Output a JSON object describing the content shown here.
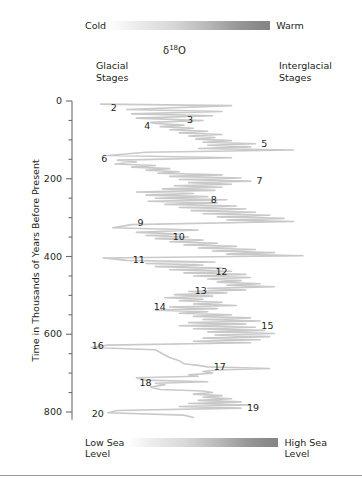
{
  "figure": {
    "delta_title": "δ",
    "delta_sup": "18",
    "delta_tail": "O",
    "glacial_heading": "Glacial\nStages",
    "interglacial_heading": "Interglacial\nStages",
    "y_axis_title": "Time in Thousands of Years Before Present"
  },
  "legends": {
    "top": {
      "left_label": "Cold",
      "right_label": "Warm",
      "from_color": "#fdfdfd",
      "to_color": "#858585"
    },
    "bottom": {
      "left_label": "Low Sea\nLevel",
      "right_label": "High Sea\nLevel",
      "from_color": "#fdfdfd",
      "to_color": "#858585"
    }
  },
  "chart_data": {
    "type": "line",
    "title": "δ18O",
    "xlabel": "δ18O (cold/low sea level  →  warm/high sea level)",
    "ylabel": "Time in Thousands of Years Before Present",
    "orientation": "vertical-time-axis",
    "grid": false,
    "legend_position": "none",
    "ylim": [
      0,
      820
    ],
    "y_tick_labels": [
      "0",
      "200",
      "400",
      "600",
      "800"
    ],
    "y_ticks": [
      0,
      200,
      400,
      600,
      800
    ],
    "y_minor_tick_interval": 50,
    "xlim": [
      0,
      1
    ],
    "line_color": "#c9c9c9",
    "axis_color": "#6d6d6d",
    "series_name": "Marine oxygen isotope record",
    "stage_labels": [
      {
        "stage": "2",
        "age_ka": 18,
        "side": "glacial"
      },
      {
        "stage": "3",
        "age_ka": 50,
        "side": "glacial"
      },
      {
        "stage": "4",
        "age_ka": 65,
        "side": "glacial"
      },
      {
        "stage": "5",
        "age_ka": 110,
        "side": "interglacial"
      },
      {
        "stage": "6",
        "age_ka": 150,
        "side": "glacial"
      },
      {
        "stage": "7",
        "age_ka": 205,
        "side": "interglacial"
      },
      {
        "stage": "8",
        "age_ka": 255,
        "side": "glacial"
      },
      {
        "stage": "9",
        "age_ka": 315,
        "side": "interglacial"
      },
      {
        "stage": "10",
        "age_ka": 350,
        "side": "glacial"
      },
      {
        "stage": "11",
        "age_ka": 410,
        "side": "interglacial"
      },
      {
        "stage": "12",
        "age_ka": 440,
        "side": "glacial"
      },
      {
        "stage": "13",
        "age_ka": 490,
        "side": "interglacial"
      },
      {
        "stage": "14",
        "age_ka": 530,
        "side": "glacial"
      },
      {
        "stage": "15",
        "age_ka": 580,
        "side": "interglacial"
      },
      {
        "stage": "16",
        "age_ka": 630,
        "side": "glacial"
      },
      {
        "stage": "17",
        "age_ka": 685,
        "side": "interglacial"
      },
      {
        "stage": "18",
        "age_ka": 725,
        "side": "glacial"
      },
      {
        "stage": "19",
        "age_ka": 790,
        "side": "interglacial"
      },
      {
        "stage": "20",
        "age_ka": 805,
        "side": "glacial"
      }
    ],
    "curve_points": [
      [
        0.07,
        8
      ],
      [
        0.62,
        12
      ],
      [
        0.18,
        22
      ],
      [
        0.58,
        27
      ],
      [
        0.2,
        33
      ],
      [
        0.54,
        38
      ],
      [
        0.22,
        44
      ],
      [
        0.5,
        50
      ],
      [
        0.28,
        55
      ],
      [
        0.3,
        58
      ],
      [
        0.42,
        62
      ],
      [
        0.32,
        66
      ],
      [
        0.46,
        70
      ],
      [
        0.36,
        74
      ],
      [
        0.52,
        78
      ],
      [
        0.4,
        82
      ],
      [
        0.58,
        86
      ],
      [
        0.44,
        90
      ],
      [
        0.55,
        94
      ],
      [
        0.47,
        98
      ],
      [
        0.62,
        102
      ],
      [
        0.5,
        106
      ],
      [
        0.72,
        110
      ],
      [
        0.52,
        114
      ],
      [
        0.7,
        118
      ],
      [
        0.48,
        122
      ],
      [
        0.88,
        126
      ],
      [
        0.26,
        132
      ],
      [
        0.1,
        140
      ],
      [
        0.62,
        146
      ],
      [
        0.14,
        152
      ],
      [
        0.22,
        157
      ],
      [
        0.13,
        162
      ],
      [
        0.3,
        166
      ],
      [
        0.2,
        170
      ],
      [
        0.36,
        174
      ],
      [
        0.26,
        178
      ],
      [
        0.4,
        182
      ],
      [
        0.31,
        186
      ],
      [
        0.58,
        190
      ],
      [
        0.36,
        194
      ],
      [
        0.66,
        198
      ],
      [
        0.4,
        202
      ],
      [
        0.7,
        206
      ],
      [
        0.44,
        210
      ],
      [
        0.62,
        214
      ],
      [
        0.38,
        218
      ],
      [
        0.58,
        222
      ],
      [
        0.33,
        226
      ],
      [
        0.55,
        230
      ],
      [
        0.22,
        234
      ],
      [
        0.46,
        238
      ],
      [
        0.26,
        242
      ],
      [
        0.52,
        246
      ],
      [
        0.3,
        250
      ],
      [
        0.6,
        254
      ],
      [
        0.27,
        258
      ],
      [
        0.56,
        262
      ],
      [
        0.34,
        266
      ],
      [
        0.64,
        270
      ],
      [
        0.4,
        274
      ],
      [
        0.68,
        278
      ],
      [
        0.45,
        282
      ],
      [
        0.72,
        286
      ],
      [
        0.5,
        290
      ],
      [
        0.78,
        294
      ],
      [
        0.56,
        298
      ],
      [
        0.84,
        302
      ],
      [
        0.6,
        306
      ],
      [
        0.88,
        310
      ],
      [
        0.2,
        318
      ],
      [
        0.12,
        326
      ],
      [
        0.48,
        332
      ],
      [
        0.22,
        338
      ],
      [
        0.4,
        342
      ],
      [
        0.26,
        346
      ],
      [
        0.44,
        350
      ],
      [
        0.3,
        354
      ],
      [
        0.5,
        358
      ],
      [
        0.36,
        362
      ],
      [
        0.56,
        366
      ],
      [
        0.42,
        370
      ],
      [
        0.64,
        374
      ],
      [
        0.48,
        378
      ],
      [
        0.72,
        382
      ],
      [
        0.54,
        386
      ],
      [
        0.8,
        390
      ],
      [
        0.6,
        394
      ],
      [
        0.92,
        398
      ],
      [
        0.08,
        404
      ],
      [
        0.18,
        410
      ],
      [
        0.55,
        414
      ],
      [
        0.26,
        418
      ],
      [
        0.5,
        422
      ],
      [
        0.3,
        426
      ],
      [
        0.58,
        430
      ],
      [
        0.36,
        434
      ],
      [
        0.62,
        438
      ],
      [
        0.42,
        442
      ],
      [
        0.68,
        446
      ],
      [
        0.46,
        450
      ],
      [
        0.7,
        454
      ],
      [
        0.52,
        458
      ],
      [
        0.66,
        462
      ],
      [
        0.56,
        466
      ],
      [
        0.74,
        470
      ],
      [
        0.6,
        474
      ],
      [
        0.8,
        478
      ],
      [
        0.52,
        482
      ],
      [
        0.68,
        486
      ],
      [
        0.44,
        490
      ],
      [
        0.6,
        494
      ],
      [
        0.38,
        498
      ],
      [
        0.54,
        502
      ],
      [
        0.34,
        506
      ],
      [
        0.5,
        510
      ],
      [
        0.4,
        514
      ],
      [
        0.58,
        518
      ],
      [
        0.46,
        522
      ],
      [
        0.64,
        526
      ],
      [
        0.36,
        530
      ],
      [
        0.56,
        534
      ],
      [
        0.3,
        538
      ],
      [
        0.52,
        542
      ],
      [
        0.4,
        546
      ],
      [
        0.62,
        550
      ],
      [
        0.46,
        554
      ],
      [
        0.7,
        558
      ],
      [
        0.5,
        562
      ],
      [
        0.74,
        566
      ],
      [
        0.44,
        570
      ],
      [
        0.68,
        574
      ],
      [
        0.4,
        578
      ],
      [
        0.72,
        582
      ],
      [
        0.46,
        586
      ],
      [
        0.76,
        590
      ],
      [
        0.52,
        594
      ],
      [
        0.8,
        598
      ],
      [
        0.55,
        602
      ],
      [
        0.78,
        606
      ],
      [
        0.5,
        610
      ],
      [
        0.74,
        614
      ],
      [
        0.46,
        618
      ],
      [
        0.7,
        622
      ],
      [
        0.1,
        628
      ],
      [
        0.03,
        634
      ],
      [
        0.3,
        640
      ],
      [
        0.33,
        650
      ],
      [
        0.36,
        660
      ],
      [
        0.4,
        668
      ],
      [
        0.42,
        676
      ],
      [
        0.48,
        680
      ],
      [
        0.52,
        684
      ],
      [
        0.78,
        688
      ],
      [
        0.56,
        692
      ],
      [
        0.5,
        696
      ],
      [
        0.54,
        700
      ],
      [
        0.44,
        704
      ],
      [
        0.48,
        708
      ],
      [
        0.22,
        712
      ],
      [
        0.26,
        718
      ],
      [
        0.52,
        722
      ],
      [
        0.3,
        726
      ],
      [
        0.34,
        730
      ],
      [
        0.28,
        736
      ],
      [
        0.32,
        742
      ],
      [
        0.5,
        746
      ],
      [
        0.54,
        750
      ],
      [
        0.46,
        754
      ],
      [
        0.58,
        758
      ],
      [
        0.5,
        762
      ],
      [
        0.62,
        766
      ],
      [
        0.48,
        770
      ],
      [
        0.66,
        774
      ],
      [
        0.44,
        778
      ],
      [
        0.7,
        782
      ],
      [
        0.4,
        786
      ],
      [
        0.66,
        790
      ],
      [
        0.14,
        796
      ],
      [
        0.1,
        802
      ],
      [
        0.42,
        808
      ],
      [
        0.46,
        814
      ]
    ]
  }
}
